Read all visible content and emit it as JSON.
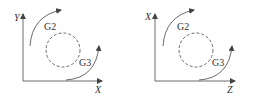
{
  "diagrams": [
    {
      "vertical_axis": "Y",
      "horizontal_axis": "X",
      "upper_arc_label": "G2",
      "lower_arc_label": "G3"
    },
    {
      "vertical_axis": "X",
      "horizontal_axis": "Z",
      "upper_arc_label": "G2",
      "lower_arc_label": "G3"
    }
  ],
  "colors": {
    "line": "#444444",
    "background": "#ffffff"
  }
}
